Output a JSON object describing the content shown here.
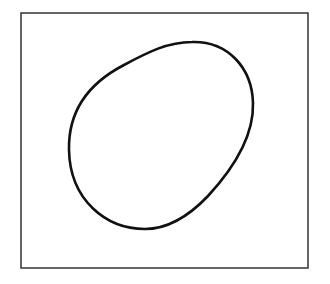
{
  "figure": {
    "frame": {
      "x": 21,
      "y": 13,
      "width": 287,
      "height": 255,
      "stroke": "#333333",
      "stroke_width": 1.5
    },
    "shape": {
      "type": "closed-curve-egg",
      "stroke": "#111111",
      "stroke_width": 2.6,
      "fill": "none",
      "path": "M 192 42 C 228 41, 252 68, 253 103 C 254 138, 232 170, 208 196 C 188 217, 168 229, 145 229 C 106 229, 70 200, 69 150 C 68 105, 95 80, 124 65 C 148 52, 168 42, 192 42 Z"
    }
  }
}
